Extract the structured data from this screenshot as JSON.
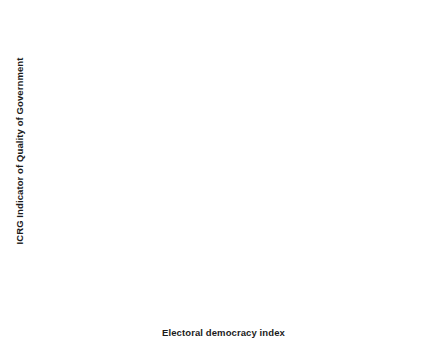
{
  "chart_data": {
    "type": "scatter",
    "title": "",
    "xlabel": "Electoral democracy index",
    "ylabel": "ICRG Indicator of Quality of Government",
    "xlim": [
      -0.02,
      0.96
    ],
    "ylim": [
      0.04,
      1.03
    ],
    "xticks": [
      0.0,
      0.25,
      0.5,
      0.75
    ],
    "xticklabels": [
      "0.00",
      "0.25",
      "0.50",
      "0.75"
    ],
    "yticks": [
      0.25,
      0.5,
      0.75,
      1.0
    ],
    "yticklabels": [
      "0.25",
      "0.50",
      "0.75",
      "1.00"
    ],
    "grid": true,
    "legend": false,
    "panel_background": "#ffffff",
    "grid_color": "#e8e8e8",
    "point_color": "#1a1a1a",
    "line_color": "#2b2b2b",
    "band_color": "#808080",
    "series": [
      {
        "name": "Countries",
        "type": "scatter",
        "points": [
          [
            0.02,
            0.61
          ],
          [
            0.06,
            0.297
          ],
          [
            0.063,
            0.47
          ],
          [
            0.07,
            0.665
          ],
          [
            0.092,
            0.698
          ],
          [
            0.098,
            0.248
          ],
          [
            0.105,
            0.549
          ],
          [
            0.118,
            0.43
          ],
          [
            0.123,
            0.418
          ],
          [
            0.128,
            0.47
          ],
          [
            0.131,
            0.093
          ],
          [
            0.14,
            0.36
          ],
          [
            0.15,
            0.608
          ],
          [
            0.155,
            0.52
          ],
          [
            0.162,
            0.446
          ],
          [
            0.172,
            0.445
          ],
          [
            0.186,
            0.488
          ],
          [
            0.19,
            0.396
          ],
          [
            0.192,
            0.267
          ],
          [
            0.196,
            0.25
          ],
          [
            0.2,
            0.249
          ],
          [
            0.206,
            0.445
          ],
          [
            0.215,
            0.322
          ],
          [
            0.221,
            0.549
          ],
          [
            0.228,
            0.48
          ],
          [
            0.236,
            0.549
          ],
          [
            0.24,
            0.31
          ],
          [
            0.245,
            0.34
          ],
          [
            0.248,
            0.204
          ],
          [
            0.252,
            0.608
          ],
          [
            0.256,
            0.142
          ],
          [
            0.26,
            0.549
          ],
          [
            0.266,
            0.549
          ],
          [
            0.272,
            0.358
          ],
          [
            0.278,
            0.445
          ],
          [
            0.286,
            0.445
          ],
          [
            0.29,
            0.329
          ],
          [
            0.296,
            0.379
          ],
          [
            0.3,
            0.358
          ],
          [
            0.306,
            0.372
          ],
          [
            0.312,
            0.354
          ],
          [
            0.32,
            0.374
          ],
          [
            0.324,
            0.445
          ],
          [
            0.326,
            0.445
          ],
          [
            0.334,
            0.862
          ],
          [
            0.336,
            0.142
          ],
          [
            0.34,
            0.48
          ],
          [
            0.344,
            0.359
          ],
          [
            0.35,
            0.258
          ],
          [
            0.356,
            0.345
          ],
          [
            0.36,
            0.386
          ],
          [
            0.364,
            0.48
          ],
          [
            0.368,
            0.445
          ],
          [
            0.372,
            0.36
          ],
          [
            0.376,
            0.333
          ],
          [
            0.384,
            0.428
          ],
          [
            0.388,
            0.249
          ],
          [
            0.392,
            0.445
          ],
          [
            0.396,
            0.48
          ],
          [
            0.4,
            0.5
          ],
          [
            0.402,
            0.5
          ],
          [
            0.406,
            0.28
          ],
          [
            0.41,
            0.27
          ],
          [
            0.414,
            0.48
          ],
          [
            0.418,
            0.412
          ],
          [
            0.42,
            0.412
          ],
          [
            0.424,
            0.31
          ],
          [
            0.428,
            0.278
          ],
          [
            0.432,
            0.465
          ],
          [
            0.438,
            0.29
          ],
          [
            0.444,
            0.445
          ],
          [
            0.448,
            0.52
          ],
          [
            0.452,
            0.266
          ],
          [
            0.456,
            0.249
          ],
          [
            0.46,
            0.31
          ],
          [
            0.464,
            0.305
          ],
          [
            0.468,
            0.418
          ],
          [
            0.472,
            0.29
          ],
          [
            0.478,
            0.637
          ],
          [
            0.48,
            0.63
          ],
          [
            0.484,
            0.46
          ],
          [
            0.488,
            0.468
          ],
          [
            0.492,
            0.375
          ],
          [
            0.496,
            0.698
          ],
          [
            0.5,
            0.5
          ],
          [
            0.504,
            0.608
          ],
          [
            0.508,
            0.578
          ],
          [
            0.512,
            0.51
          ],
          [
            0.516,
            0.484
          ],
          [
            0.52,
            0.362
          ],
          [
            0.524,
            0.59
          ],
          [
            0.528,
            0.428
          ],
          [
            0.532,
            0.47
          ],
          [
            0.536,
            0.418
          ],
          [
            0.542,
            0.806
          ],
          [
            0.548,
            0.726
          ],
          [
            0.552,
            0.36
          ],
          [
            0.556,
            0.445
          ],
          [
            0.56,
            0.445
          ],
          [
            0.564,
            0.445
          ],
          [
            0.568,
            0.862
          ],
          [
            0.572,
            0.698
          ],
          [
            0.58,
            0.47
          ],
          [
            0.584,
            0.54
          ],
          [
            0.588,
            0.58
          ],
          [
            0.592,
            0.448
          ],
          [
            0.6,
            0.75
          ],
          [
            0.604,
            0.698
          ],
          [
            0.608,
            0.698
          ],
          [
            0.612,
            0.698
          ],
          [
            0.616,
            0.5
          ],
          [
            0.62,
            0.64
          ],
          [
            0.624,
            0.64
          ],
          [
            0.628,
            0.385
          ],
          [
            0.632,
            0.9
          ],
          [
            0.636,
            0.9
          ],
          [
            0.64,
            0.9
          ],
          [
            0.644,
            0.93
          ],
          [
            0.648,
            0.93
          ],
          [
            0.652,
            0.975
          ],
          [
            0.656,
            0.94
          ],
          [
            0.66,
            0.975
          ],
          [
            0.664,
            0.862
          ],
          [
            0.668,
            0.748
          ],
          [
            0.672,
            0.728
          ],
          [
            0.676,
            0.65
          ],
          [
            0.68,
            0.89
          ],
          [
            0.684,
            0.778
          ]
        ]
      },
      {
        "name": "Fitted curve",
        "type": "line",
        "points": [
          [
            0.02,
            0.537
          ],
          [
            0.08,
            0.493
          ],
          [
            0.14,
            0.458
          ],
          [
            0.2,
            0.431
          ],
          [
            0.26,
            0.411
          ],
          [
            0.32,
            0.396
          ],
          [
            0.38,
            0.387
          ],
          [
            0.44,
            0.382
          ],
          [
            0.5,
            0.385
          ],
          [
            0.56,
            0.398
          ],
          [
            0.62,
            0.425
          ],
          [
            0.68,
            0.47
          ],
          [
            0.74,
            0.54
          ],
          [
            0.8,
            0.635
          ],
          [
            0.86,
            0.755
          ],
          [
            0.92,
            0.9
          ]
        ]
      },
      {
        "name": "Confidence band upper",
        "type": "band-upper",
        "points": [
          [
            0.02,
            0.675
          ],
          [
            0.08,
            0.585
          ],
          [
            0.14,
            0.512
          ],
          [
            0.2,
            0.466
          ],
          [
            0.26,
            0.437
          ],
          [
            0.32,
            0.418
          ],
          [
            0.38,
            0.408
          ],
          [
            0.44,
            0.404
          ],
          [
            0.5,
            0.409
          ],
          [
            0.56,
            0.424
          ],
          [
            0.62,
            0.452
          ],
          [
            0.68,
            0.497
          ],
          [
            0.74,
            0.566
          ],
          [
            0.8,
            0.662
          ],
          [
            0.86,
            0.786
          ],
          [
            0.92,
            0.96
          ]
        ]
      },
      {
        "name": "Confidence band lower",
        "type": "band-lower",
        "points": [
          [
            0.02,
            0.412
          ],
          [
            0.08,
            0.408
          ],
          [
            0.14,
            0.404
          ],
          [
            0.2,
            0.396
          ],
          [
            0.26,
            0.386
          ],
          [
            0.32,
            0.375
          ],
          [
            0.38,
            0.367
          ],
          [
            0.44,
            0.361
          ],
          [
            0.5,
            0.362
          ],
          [
            0.56,
            0.373
          ],
          [
            0.62,
            0.399
          ],
          [
            0.68,
            0.444
          ],
          [
            0.74,
            0.515
          ],
          [
            0.8,
            0.608
          ],
          [
            0.86,
            0.725
          ],
          [
            0.92,
            0.862
          ]
        ]
      }
    ]
  }
}
